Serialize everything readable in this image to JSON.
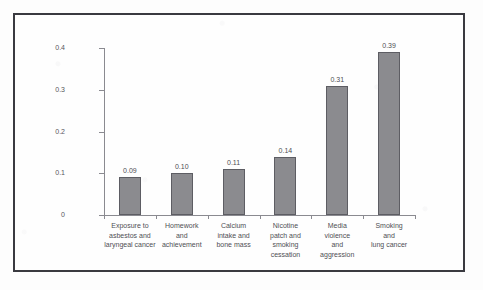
{
  "chart_data": {
    "type": "bar",
    "title": "",
    "subtitle": "",
    "xlabel": "",
    "ylabel": "",
    "ylim": [
      0,
      0.4
    ],
    "yticks": [
      "0",
      "0.1",
      "0.2",
      "0.3",
      "0.4"
    ],
    "ytick_values": [
      0,
      0.1,
      0.2,
      0.3,
      0.4
    ],
    "grid": false,
    "legend": null,
    "categories": [
      "Exposure to asbestos and laryngeal cancer",
      "Homework and achievement",
      "Calcium intake and bone mass",
      "Nicotine patch and smoking cessation",
      "Media violence and aggression",
      "Smoking and lung cancer"
    ],
    "category_lines": [
      [
        "Exposure to",
        "asbestos and",
        "laryngeal cancer"
      ],
      [
        "Homework",
        "and",
        "achievement"
      ],
      [
        "Calcium",
        "intake and",
        "bone mass"
      ],
      [
        "Nicotine",
        "patch and",
        "smoking",
        "cessation"
      ],
      [
        "Media",
        "violence",
        "and",
        "aggression"
      ],
      [
        "Smoking",
        "and",
        "lung cancer"
      ]
    ],
    "values": [
      0.09,
      0.1,
      0.11,
      0.14,
      0.31,
      0.39
    ],
    "value_labels": [
      "0.09",
      "0.10",
      "0.11",
      "0.14",
      "0.31",
      "0.39"
    ],
    "bar_color": "#8b8b8f",
    "bar_edge_color": "#5d5d63",
    "axis_color": "#8a8a90",
    "frame_color": "#3a3a40",
    "background_color": "#fefefe"
  }
}
